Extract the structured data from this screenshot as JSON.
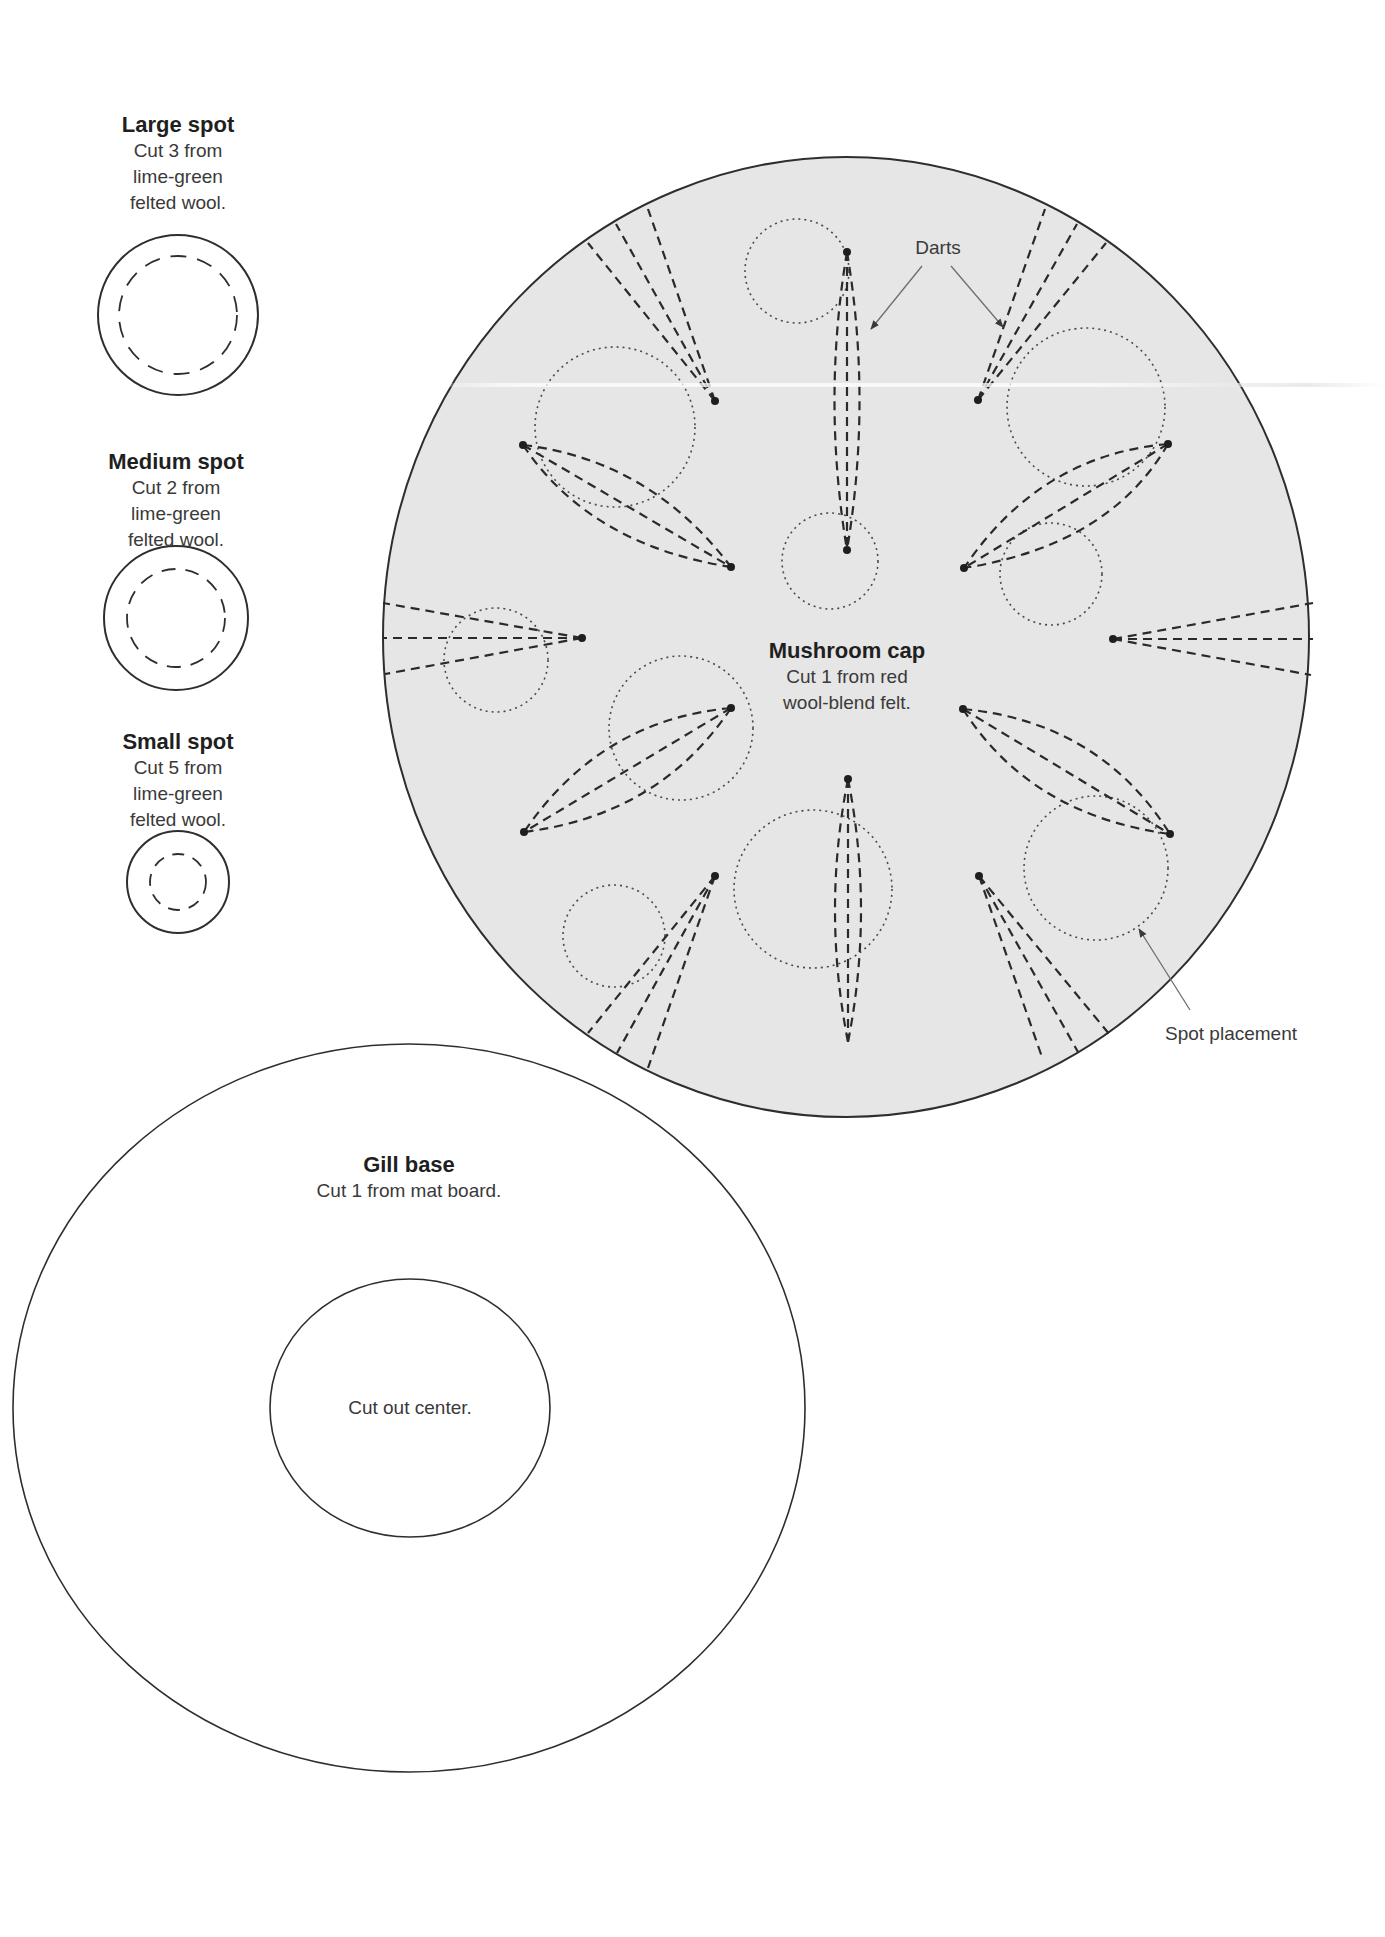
{
  "colors": {
    "cap_fill": "#e6e6e6",
    "outline": "#2e2e2e",
    "dart_line": "#2a2a2a",
    "placement_line": "#444444",
    "leader_line": "#7a7a7a",
    "text": "#2b2b2b",
    "background": "#ffffff"
  },
  "spots": {
    "large": {
      "title": "Large spot",
      "lines": [
        "Cut 3 from",
        "lime-green",
        "felted wool."
      ]
    },
    "medium": {
      "title": "Medium spot",
      "lines": [
        "Cut 2 from",
        "lime-green",
        "felted wool."
      ]
    },
    "small": {
      "title": "Small spot",
      "lines": [
        "Cut 5 from",
        "lime-green",
        "felted wool."
      ]
    }
  },
  "cap": {
    "title": "Mushroom cap",
    "lines": [
      "Cut 1 from red",
      "wool-blend felt."
    ],
    "callouts": {
      "darts": "Darts",
      "spot_placement": "Spot placement"
    }
  },
  "gill_base": {
    "title": "Gill base",
    "lines": [
      "Cut 1 from mat board."
    ],
    "center_note": "Cut out center."
  }
}
